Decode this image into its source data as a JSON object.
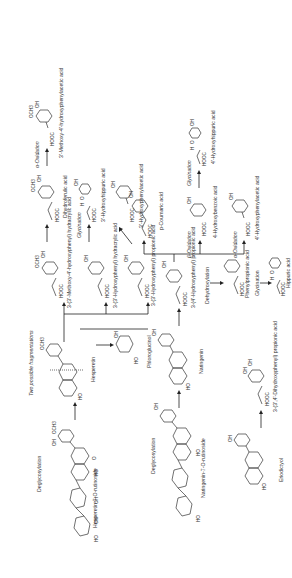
{
  "figure": {
    "compounds": {
      "hesperidin": "Hesperetin-7-O-rutinoside",
      "naringin": "Naringenin-7-O-rutinoside",
      "hesperetin": "Hesperetin",
      "naringenin": "Naringenin",
      "eriodictyol": "Eriodictyol",
      "phloroglucinol": "Phloroglucinol",
      "two_fragmentations": "Two possible fragmentations",
      "m_methoxy_hydracrylic": "3-(3'-Methoxy-4'-hydroxyphenyl) hydracrylic acid",
      "m_hydroxy_hydracrylic": "3-(3'-Hydroxyphenyl) hydracrylic acid",
      "m_hydroxy_propionic": "3-(3'-Hydroxyphenyl) propionic acid",
      "p_hydroxy_propionic": "3-(4'-Hydroxyphenyl) propionic acid",
      "dihydroxy_propionic": "3-(3',4'-Dihydroxyphenyl) propionic acid",
      "phenylpropionic": "Phenylpropionic acid",
      "hippuric": "Hippuric acid",
      "dihydroferulic": "Dihydroferulic acid",
      "m_hydroxyhippuric": "3'-Hydroxyhippuric acid",
      "m_hydroxyphenylacetic": "3'-Hydroxyphenylacetic acid",
      "methoxy_hydroxyphenylacetic": "3'-Methoxy-4'-hydroxyphenylacetic acid",
      "p_coumaric": "p-Coumaric acid",
      "p_hydroxybenzoic": "4-Hydroxybenzoic acid",
      "p_hydroxyphenylacetic": "4'-Hydroxyphenylacetic acid",
      "p_hydroxyhippuric": "4'-Hydroxyhippuric acid"
    },
    "processes": {
      "deglycosylation": "Deglycosylation",
      "dehydroxylation": "Dehydroxylation",
      "glycination": "Glycination",
      "alpha_oxidation": "α-Oxidation",
      "beta_oxidation": "β-Oxidation"
    },
    "groups": {
      "och3": "OCH3",
      "oh": "OH",
      "ho": "HO",
      "hooc": "HOOC",
      "o": "O",
      "h": "H",
      "n": "N"
    }
  }
}
